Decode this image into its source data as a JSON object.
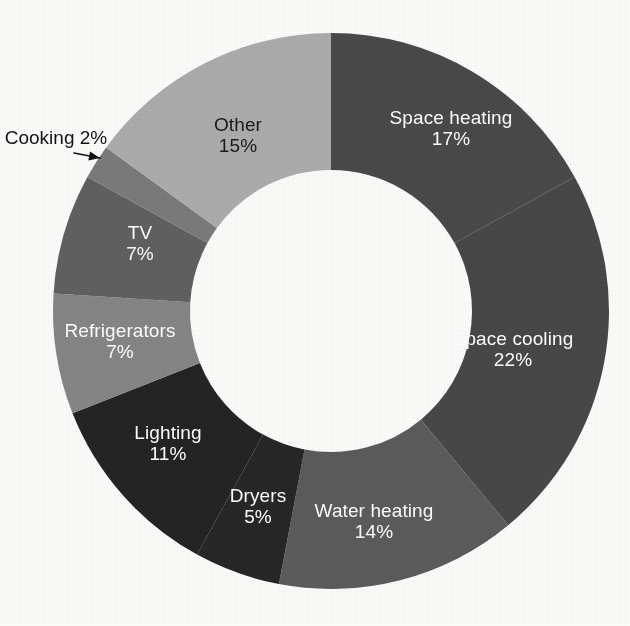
{
  "figure": {
    "background_color": "#fdfdfb",
    "center_x": 331,
    "center_y": 311,
    "outer_radius": 278,
    "inner_radius": 141,
    "start_angle_deg": -90,
    "direction": "clockwise"
  },
  "chart_data": {
    "type": "pie",
    "variant": "donut",
    "title": "",
    "subtitle": "",
    "xlabel": "",
    "ylabel": "",
    "legend_position": "none",
    "grid": false,
    "value_unit": "%",
    "total": 100,
    "categories": [
      "Space heating",
      "Space cooling",
      "Water heating",
      "Dryers",
      "Lighting",
      "Refrigerators",
      "TV",
      "Cooking",
      "Other"
    ],
    "values": [
      17,
      22,
      14,
      5,
      11,
      7,
      7,
      2,
      15
    ],
    "slices": [
      {
        "label": "Space heating",
        "percent_text": "17%",
        "value": 17,
        "color": "#4a4a4a",
        "label_color": "#ffffff",
        "label_placement": "inside",
        "label_x": 451,
        "label_y": 128
      },
      {
        "label": "Space cooling",
        "percent_text": "22%",
        "value": 22,
        "color": "#484848",
        "label_color": "#ffffff",
        "label_placement": "inside",
        "label_x": 513,
        "label_y": 349
      },
      {
        "label": "Water heating",
        "percent_text": "14%",
        "value": 14,
        "color": "#5c5c5c",
        "label_color": "#ffffff",
        "label_placement": "inside",
        "label_x": 374,
        "label_y": 521
      },
      {
        "label": "Dryers",
        "percent_text": "5%",
        "value": 5,
        "color": "#272727",
        "label_color": "#ffffff",
        "label_placement": "inside",
        "label_x": 258,
        "label_y": 506
      },
      {
        "label": "Lighting",
        "percent_text": "11%",
        "value": 11,
        "color": "#242424",
        "label_color": "#ffffff",
        "label_placement": "inside",
        "label_x": 168,
        "label_y": 443
      },
      {
        "label": "Refrigerators",
        "percent_text": "7%",
        "value": 7,
        "color": "#868686",
        "label_color": "#ffffff",
        "label_placement": "inside",
        "label_x": 120,
        "label_y": 341
      },
      {
        "label": "TV",
        "percent_text": "7%",
        "value": 7,
        "color": "#616161",
        "label_color": "#ffffff",
        "label_placement": "inside",
        "label_x": 140,
        "label_y": 243
      },
      {
        "label": "Cooking",
        "percent_text": "2%",
        "value": 2,
        "color": "#7b7b7b",
        "label_color": "#141414",
        "label_placement": "outside-callout",
        "label_x": 56,
        "label_y": 138
      },
      {
        "label": "Other",
        "percent_text": "15%",
        "value": 15,
        "color": "#adadad",
        "label_color": "#1b1b1b",
        "label_placement": "inside",
        "label_x": 238,
        "label_y": 135
      }
    ],
    "callout": {
      "label": "Cooking",
      "percent_text": "2%",
      "text_x": 56,
      "text_y": 138,
      "line_start_x": 74,
      "line_start_y": 153,
      "line_end_x": 100,
      "line_end_y": 158,
      "color": "#141414"
    }
  }
}
